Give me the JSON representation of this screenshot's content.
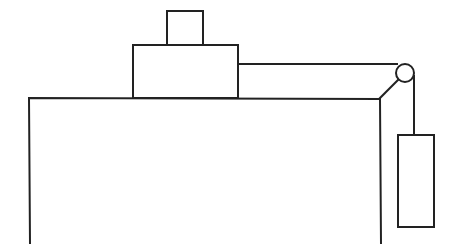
{
  "diagram": {
    "title": "",
    "colors": {
      "stroke": "#222222",
      "background": "#ffffff"
    },
    "elements": {
      "table": {
        "left": 29,
        "top": 98,
        "right": 380,
        "bottom": 243
      },
      "lower_block": {
        "x": 133,
        "y": 45,
        "w": 105,
        "h": 53
      },
      "upper_block": {
        "x": 167,
        "y": 11,
        "w": 36,
        "h": 34
      },
      "string_horizontal": {
        "x1": 238,
        "y1": 64,
        "x2": 397,
        "y2": 64
      },
      "pulley": {
        "cx": 405,
        "cy": 73,
        "r": 9
      },
      "pulley_bracket": {
        "x1": 380,
        "y1": 98,
        "x2": 398,
        "y2": 81
      },
      "string_vertical": {
        "x1": 414,
        "y1": 76,
        "x2": 414,
        "y2": 135
      },
      "hanging_mass": {
        "x": 398,
        "y": 135,
        "w": 36,
        "h": 92
      }
    }
  }
}
